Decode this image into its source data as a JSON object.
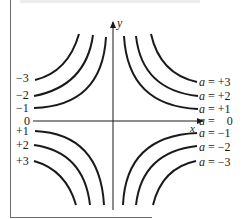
{
  "diagram": {
    "type": "level-curves",
    "axes": {
      "x_label": "x",
      "y_label": "y"
    },
    "left_labels": [
      "−3",
      "−2",
      "−1",
      "0",
      "+1",
      "+2",
      "+3"
    ],
    "right_labels": [
      {
        "var": "a",
        "eq": " = +3"
      },
      {
        "var": "a",
        "eq": " = +2"
      },
      {
        "var": "a",
        "eq": " = +1"
      },
      {
        "var": "a",
        "eq": " =    0"
      },
      {
        "var": "a",
        "eq": " = −1"
      },
      {
        "var": "a",
        "eq": " = −2"
      },
      {
        "var": "a",
        "eq": " = −3"
      }
    ],
    "curve_values": [
      -3,
      -2,
      -1,
      0,
      1,
      2,
      3
    ],
    "line_color": "#1a1a1a"
  }
}
